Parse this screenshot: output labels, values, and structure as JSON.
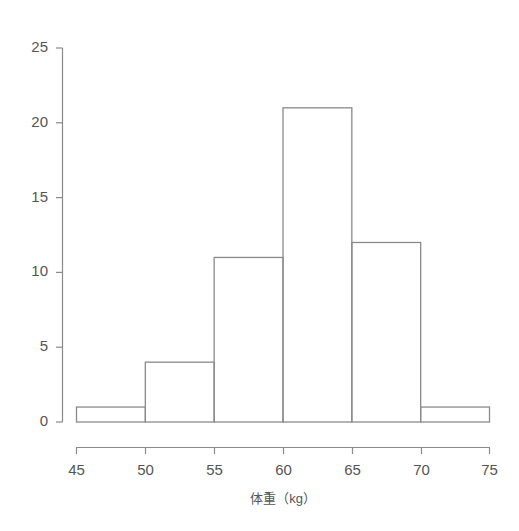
{
  "chart_data": {
    "type": "bar",
    "subtype": "histogram",
    "title": "",
    "subtitle": "",
    "xlabel": "体重（kg）",
    "ylabel": "",
    "bin_edges": [
      45,
      50,
      55,
      60,
      65,
      70,
      75
    ],
    "categories": [
      "45-50",
      "50-55",
      "55-60",
      "60-65",
      "65-70",
      "70-75"
    ],
    "values": [
      1,
      4,
      11,
      21,
      12,
      1
    ],
    "bins": [
      {
        "range": "45-50",
        "start": 45,
        "end": 50,
        "count": 1
      },
      {
        "range": "50-55",
        "start": 50,
        "end": 55,
        "count": 4
      },
      {
        "range": "55-60",
        "start": 55,
        "end": 60,
        "count": 11
      },
      {
        "range": "60-65",
        "start": 60,
        "end": 65,
        "count": 21
      },
      {
        "range": "65-70",
        "start": 65,
        "end": 70,
        "count": 12
      },
      {
        "range": "70-75",
        "start": 70,
        "end": 75,
        "count": 1
      }
    ],
    "xlim": [
      45,
      75
    ],
    "ylim": [
      0,
      25
    ],
    "xticks": [
      45,
      50,
      55,
      60,
      65,
      70,
      75
    ],
    "yticks": [
      0,
      5,
      10,
      15,
      20,
      25
    ],
    "xtick_labels": [
      "45",
      "50",
      "55",
      "60",
      "65",
      "70",
      "75"
    ],
    "ytick_labels": [
      "0",
      "5",
      "10",
      "15",
      "20",
      "25"
    ],
    "grid": false,
    "legend": null,
    "legend_position": "none",
    "annotations": [],
    "colors": {
      "background": "#ffffff",
      "bar_fill": "none",
      "bar_stroke": "#8a8a8a",
      "axis": "#8a8a8a",
      "text": "#555555"
    }
  },
  "axes": {
    "y_axis_name": "frequency-axis",
    "x_axis_name": "weight-axis"
  }
}
